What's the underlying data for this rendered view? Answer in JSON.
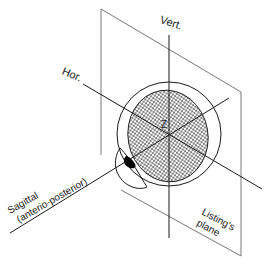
{
  "figure": {
    "labels": {
      "vertical_axis": "Vert.",
      "horizontal_axis": "Hor.",
      "center": "Z",
      "sagittal_line1": "Sagittal",
      "sagittal_line2": "(anterio-posterior)",
      "plane_line1": "Listing's",
      "plane_line2": "plane"
    },
    "colors": {
      "line": "#1a1a1a",
      "plane_line": "#555555",
      "hatch": "#2a2a2a",
      "pupil": "#000000",
      "background": "#ffffff"
    },
    "elements": [
      {
        "name": "listings-plane",
        "type": "parallelogram"
      },
      {
        "name": "eyeball",
        "type": "circle"
      },
      {
        "name": "hatched-plane-section",
        "type": "ellipse"
      },
      {
        "name": "cornea",
        "type": "lens"
      },
      {
        "name": "pupil",
        "type": "blob"
      },
      {
        "name": "vertical-axis",
        "type": "line"
      },
      {
        "name": "horizontal-axis",
        "type": "line"
      },
      {
        "name": "sagittal-axis",
        "type": "line"
      }
    ]
  }
}
